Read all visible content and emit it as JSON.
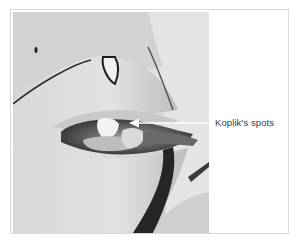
{
  "figure": {
    "photo_description": "Black-and-white clinical photograph of a patient's face with open mouth showing inner cheek",
    "annotation": {
      "label": "Koplik's spots",
      "arrow_direction": "left",
      "arrow_color": "#ffffff"
    },
    "colors": {
      "frame_border": "#d9d9d9",
      "label_text": "#3a3a3a",
      "background": "#ffffff"
    }
  }
}
